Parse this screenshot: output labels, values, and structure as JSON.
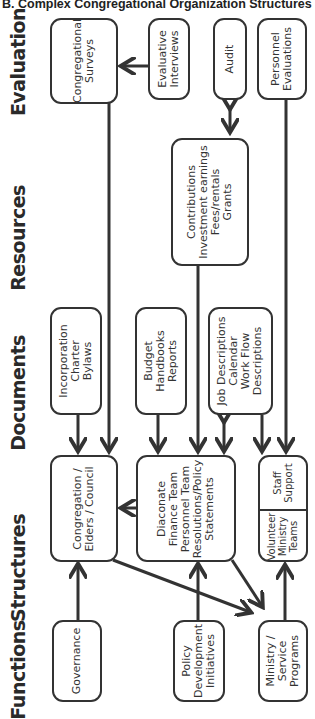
{
  "title": "B. Complex Congregational Organization Structures",
  "rows": [
    {
      "id": "evaluation",
      "label": "Evaluation"
    },
    {
      "id": "resources",
      "label": "Resources"
    },
    {
      "id": "documents",
      "label": "Documents"
    },
    {
      "id": "structures",
      "label": "Structures"
    },
    {
      "id": "functions",
      "label": "Functions"
    }
  ],
  "nodes": {
    "congregational_surveys": {
      "lines": [
        "Congregational",
        "Surveys"
      ]
    },
    "evaluative_interviews": {
      "lines": [
        "Evaluative",
        "Interviews"
      ]
    },
    "audit": {
      "lines": [
        "Audit"
      ]
    },
    "personnel_evaluations": {
      "lines": [
        "Personnel",
        "Evaluations"
      ]
    },
    "contributions": {
      "lines": [
        "Contributions",
        "Investment earnings",
        "Fees/rentals",
        "Grants"
      ]
    },
    "incorporation": {
      "lines": [
        "Incorporation",
        "Charter",
        "Bylaws"
      ]
    },
    "budget": {
      "lines": [
        "Budget",
        "Handbooks",
        "Reports"
      ]
    },
    "job_descriptions": {
      "lines": [
        "Job Descriptions",
        "Calendar",
        "Work Flow",
        "Descriptions"
      ]
    },
    "congregation_elders": {
      "lines": [
        "Congregation /",
        "Elders / Council"
      ]
    },
    "diaconate": {
      "lines": [
        "Diaconate",
        "Finance Team",
        "Personnel Team",
        "Resolutions/Policy",
        "Statements"
      ]
    },
    "volunteer_ministry": {
      "lines": [
        "Volunteer",
        "Ministry",
        "Teams"
      ]
    },
    "staff_support": {
      "lines": [
        "Staff",
        "Support"
      ]
    },
    "governance": {
      "lines": [
        "Governance"
      ]
    },
    "policy_development": {
      "lines": [
        "Policy",
        "Development",
        "Initiatives"
      ]
    },
    "ministry_service": {
      "lines": [
        "Ministry /",
        "Service",
        "Programs"
      ]
    }
  },
  "edges": [
    {
      "from": "evaluative_interviews",
      "to": "congregational_surveys"
    },
    {
      "from": "congregational_surveys",
      "to": "congregation_elders"
    },
    {
      "from": "audit",
      "to": "contributions",
      "bidirectional": true
    },
    {
      "from": "personnel_evaluations",
      "to": "staff_support"
    },
    {
      "from": "contributions",
      "to": "diaconate"
    },
    {
      "from": "incorporation",
      "to": "congregation_elders"
    },
    {
      "from": "budget",
      "to": "diaconate"
    },
    {
      "from": "job_descriptions",
      "to": "diaconate",
      "bidirectional": true
    },
    {
      "from": "job_descriptions",
      "to": "volunteer_ministry"
    },
    {
      "from": "diaconate",
      "to": "congregation_elders"
    },
    {
      "from": "governance",
      "to": "congregation_elders"
    },
    {
      "from": "policy_development",
      "to": "diaconate"
    },
    {
      "from": "congregation_elders",
      "to": "ministry_service"
    },
    {
      "from": "diaconate",
      "to": "ministry_service"
    },
    {
      "from": "ministry_service",
      "to": "volunteer_ministry"
    }
  ],
  "colors": {
    "stroke": "#333333",
    "text": "#333333",
    "background": "#ffffff"
  }
}
